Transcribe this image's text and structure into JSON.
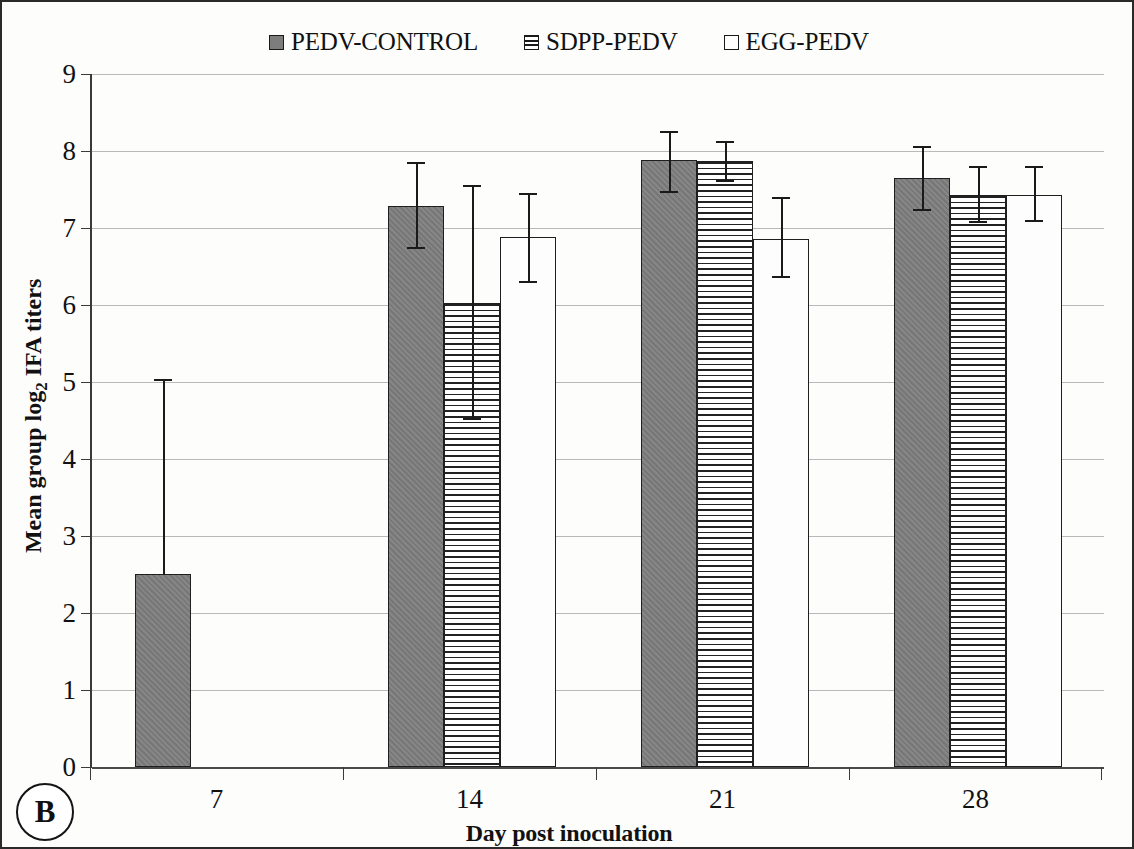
{
  "panel": {
    "label": "B"
  },
  "legend": [
    {
      "label": "PEDV-CONTROL",
      "style": "solid",
      "color": "#7d7d7d"
    },
    {
      "label": "SDPP-PEDV",
      "style": "hatch",
      "color": "#ffffff"
    },
    {
      "label": "EGG-PEDV",
      "style": "open",
      "color": "#ffffff"
    }
  ],
  "axis": {
    "y_title_pre": "Mean group log",
    "y_title_sub": "2",
    "y_title_post": " IFA titers",
    "x_title": "Day post inoculation",
    "y_ticks": [
      "0",
      "1",
      "2",
      "3",
      "4",
      "5",
      "6",
      "7",
      "8",
      "9"
    ],
    "x_ticks": [
      "7",
      "14",
      "21",
      "28"
    ]
  },
  "chart_data": {
    "type": "bar",
    "title": "",
    "xlabel": "Day post inoculation",
    "ylabel": "Mean group log2 IFA titers",
    "ylim": [
      0,
      9
    ],
    "ytick_step": 1,
    "grid": true,
    "legend_position": "top-center",
    "categories": [
      "7",
      "14",
      "21",
      "28"
    ],
    "series": [
      {
        "name": "PEDV-CONTROL",
        "fill": "solid-gray",
        "values": [
          2.51,
          7.29,
          7.88,
          7.65
        ],
        "err_low": [
          2.51,
          6.73,
          7.45,
          7.22
        ],
        "err_high": [
          5.04,
          7.86,
          8.26,
          8.07
        ]
      },
      {
        "name": "SDPP-PEDV",
        "fill": "horizontal-hatch",
        "values": [
          0,
          6.03,
          7.87,
          7.43
        ],
        "err_low": [
          0,
          4.5,
          7.6,
          7.07
        ],
        "err_high": [
          0,
          7.56,
          8.13,
          7.8
        ]
      },
      {
        "name": "EGG-PEDV",
        "fill": "open-white",
        "values": [
          0,
          6.88,
          6.86,
          7.43
        ],
        "err_low": [
          0,
          6.28,
          6.35,
          7.08
        ],
        "err_high": [
          0,
          7.46,
          7.4,
          7.8
        ]
      }
    ]
  }
}
